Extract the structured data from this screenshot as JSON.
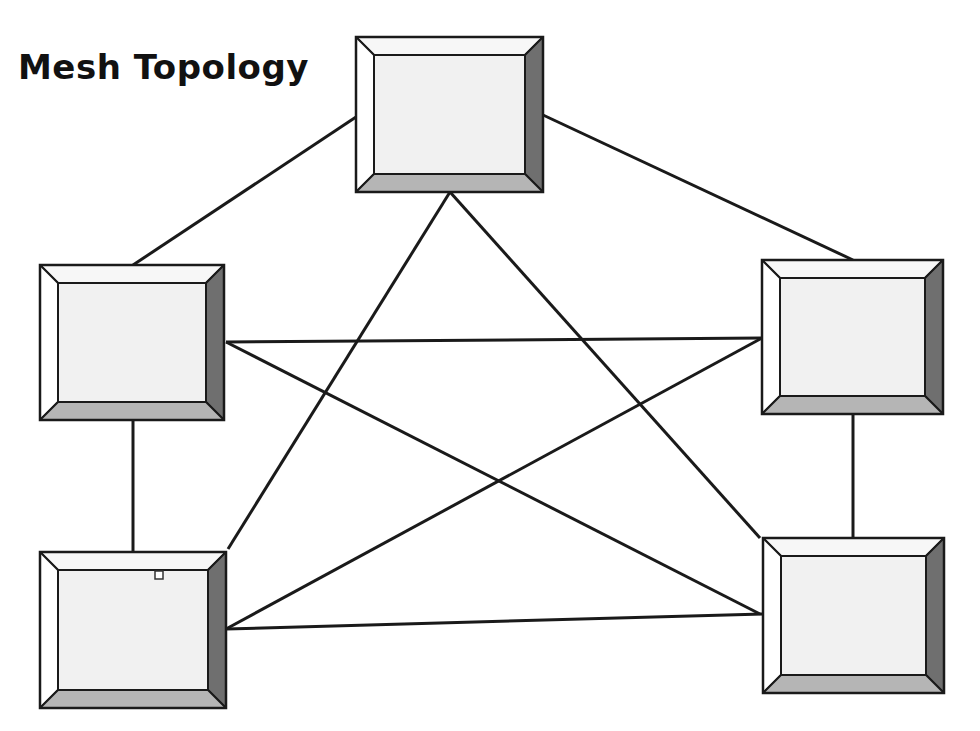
{
  "title": "Mesh Topology",
  "colors": {
    "line": "#1a1a1a",
    "face": "#f1f1f1",
    "bevel_top": "#f7f7f7",
    "bevel_left": "#ffffff",
    "bevel_right": "#6f6f6f",
    "bevel_bottom": "#b5b5b5"
  },
  "nodes": [
    {
      "id": "top",
      "x": 356,
      "y": 37,
      "w": 187,
      "h": 155
    },
    {
      "id": "left-upper",
      "x": 40,
      "y": 265,
      "w": 184,
      "h": 155
    },
    {
      "id": "right-upper",
      "x": 762,
      "y": 260,
      "w": 181,
      "h": 154
    },
    {
      "id": "left-lower",
      "x": 40,
      "y": 552,
      "w": 186,
      "h": 156
    },
    {
      "id": "right-lower",
      "x": 763,
      "y": 538,
      "w": 181,
      "h": 155
    }
  ],
  "links": [
    {
      "x1": 356,
      "y1": 117,
      "x2": 133,
      "y2": 265
    },
    {
      "x1": 543,
      "y1": 115,
      "x2": 853,
      "y2": 260
    },
    {
      "x1": 450,
      "y1": 192,
      "x2": 228,
      "y2": 549
    },
    {
      "x1": 450,
      "y1": 192,
      "x2": 760,
      "y2": 538
    },
    {
      "x1": 226,
      "y1": 342,
      "x2": 762,
      "y2": 338
    },
    {
      "x1": 226,
      "y1": 342,
      "x2": 760,
      "y2": 614
    },
    {
      "x1": 226,
      "y1": 629,
      "x2": 762,
      "y2": 338
    },
    {
      "x1": 226,
      "y1": 629,
      "x2": 763,
      "y2": 614
    },
    {
      "x1": 133,
      "y1": 420,
      "x2": 133,
      "y2": 552
    },
    {
      "x1": 853,
      "y1": 414,
      "x2": 853,
      "y2": 538
    }
  ],
  "marker": {
    "x": 155,
    "y": 571,
    "size": 8
  }
}
